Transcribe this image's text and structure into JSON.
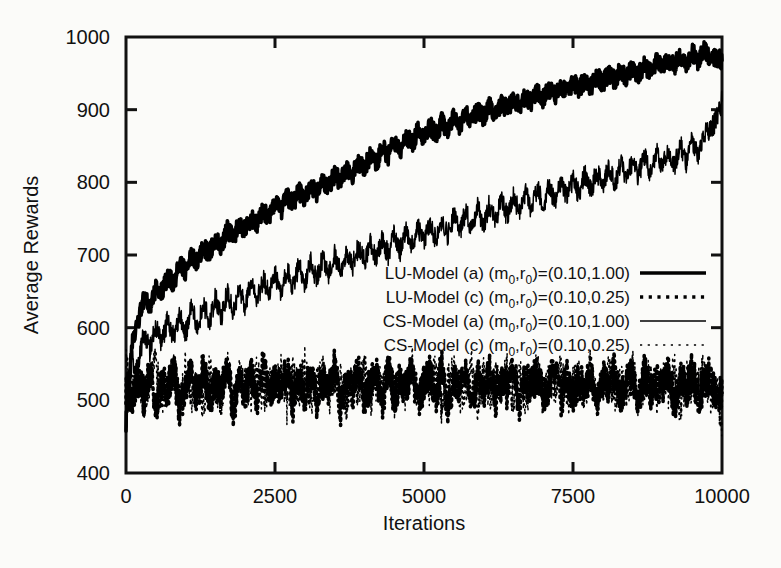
{
  "chart_data": {
    "type": "line",
    "title": "",
    "xlabel": "Iterations",
    "ylabel": "Average Rewards",
    "xlim": [
      0,
      10000
    ],
    "ylim": [
      400,
      1000
    ],
    "xticks": [
      0,
      2500,
      5000,
      7500,
      10000
    ],
    "yticks": [
      400,
      500,
      600,
      700,
      800,
      900,
      1000
    ],
    "xticklabels": [
      "0",
      "2500",
      "5000",
      "7500",
      "10000"
    ],
    "yticklabels": [
      "400",
      "500",
      "600",
      "700",
      "800",
      "900",
      "1000"
    ],
    "grid": false,
    "legend_position": "center-right-inside",
    "series": [
      {
        "name": "LU-Model (a) (m0,r0)=(0.10,1.00)",
        "style": "thick-solid",
        "color": "#000000",
        "x": [
          0,
          100,
          200,
          300,
          400,
          500,
          600,
          700,
          800,
          900,
          1000,
          1100,
          1200,
          1300,
          1400,
          1500,
          1600,
          1700,
          1800,
          1900,
          2000,
          2100,
          2200,
          2300,
          2400,
          2500,
          2600,
          2700,
          2800,
          2900,
          3000,
          3100,
          3200,
          3300,
          3400,
          3500,
          3600,
          3700,
          3800,
          3900,
          4000,
          4100,
          4200,
          4300,
          4400,
          4500,
          4600,
          4700,
          4800,
          4900,
          5000,
          5100,
          5200,
          5300,
          5400,
          5500,
          5600,
          5700,
          5800,
          5900,
          6000,
          6100,
          6200,
          6300,
          6400,
          6500,
          6600,
          6700,
          6800,
          6900,
          7000,
          7100,
          7200,
          7300,
          7400,
          7500,
          7600,
          7700,
          7800,
          7900,
          8000,
          8100,
          8200,
          8300,
          8400,
          8500,
          8600,
          8700,
          8800,
          8900,
          9000,
          9100,
          9200,
          9300,
          9400,
          9500,
          9600,
          9700,
          9800,
          9900,
          10000
        ],
        "y": [
          505,
          600,
          618,
          640,
          628,
          655,
          648,
          672,
          660,
          690,
          676,
          700,
          688,
          712,
          702,
          724,
          712,
          735,
          724,
          742,
          733,
          752,
          740,
          762,
          752,
          772,
          760,
          780,
          770,
          788,
          776,
          796,
          784,
          805,
          792,
          812,
          800,
          820,
          810,
          828,
          818,
          838,
          826,
          848,
          836,
          858,
          844,
          866,
          852,
          872,
          860,
          878,
          866,
          884,
          872,
          890,
          878,
          896,
          884,
          900,
          890,
          906,
          894,
          910,
          900,
          916,
          904,
          920,
          910,
          924,
          914,
          930,
          918,
          934,
          922,
          938,
          928,
          942,
          932,
          946,
          936,
          950,
          940,
          954,
          944,
          958,
          948,
          962,
          952,
          966,
          956,
          970,
          960,
          975,
          964,
          980,
          966,
          984,
          968,
          972,
          968
        ]
      },
      {
        "name": "LU-Model (c) (m0,r0)=(0.10,0.25)",
        "style": "thick-dotted",
        "color": "#000000",
        "x": [
          0,
          100,
          200,
          300,
          400,
          500,
          600,
          700,
          800,
          900,
          1000,
          1100,
          1200,
          1300,
          1400,
          1500,
          1600,
          1700,
          1800,
          1900,
          2000,
          2100,
          2200,
          2300,
          2400,
          2500,
          2600,
          2700,
          2800,
          2900,
          3000,
          3100,
          3200,
          3300,
          3400,
          3500,
          3600,
          3700,
          3800,
          3900,
          4000,
          4100,
          4200,
          4300,
          4400,
          4500,
          4600,
          4700,
          4800,
          4900,
          5000,
          5100,
          5200,
          5300,
          5400,
          5500,
          5600,
          5700,
          5800,
          5900,
          6000,
          6100,
          6200,
          6300,
          6400,
          6500,
          6600,
          6700,
          6800,
          6900,
          7000,
          7100,
          7200,
          7300,
          7400,
          7500,
          7600,
          7700,
          7800,
          7900,
          8000,
          8100,
          8200,
          8300,
          8400,
          8500,
          8600,
          8700,
          8800,
          8900,
          9000,
          9100,
          9200,
          9300,
          9400,
          9500,
          9600,
          9700,
          9800,
          9900,
          10000
        ],
        "y": [
          520,
          498,
          532,
          505,
          540,
          492,
          528,
          512,
          545,
          488,
          522,
          535,
          500,
          548,
          495,
          525,
          515,
          542,
          490,
          530,
          508,
          538,
          498,
          550,
          502,
          528,
          518,
          545,
          492,
          534,
          506,
          540,
          496,
          526,
          516,
          548,
          488,
          532,
          510,
          544,
          500,
          522,
          536,
          498,
          542,
          504,
          530,
          514,
          546,
          494,
          524,
          538,
          502,
          548,
          490,
          528,
          518,
          540,
          496,
          534,
          508,
          544,
          500,
          526,
          512,
          546,
          492,
          530,
          520,
          538,
          502,
          522,
          542,
          498,
          536,
          506,
          528,
          516,
          544,
          494,
          532,
          510,
          548,
          500,
          524,
          534,
          496,
          540,
          508,
          526,
          518,
          546,
          492,
          530,
          514,
          542,
          504,
          522,
          536,
          500,
          510
        ]
      },
      {
        "name": "CS-Model (a) (m0,r0)=(0.10,1.00)",
        "style": "thin-solid",
        "color": "#000000",
        "x": [
          0,
          100,
          200,
          300,
          400,
          500,
          600,
          700,
          800,
          900,
          1000,
          1100,
          1200,
          1300,
          1400,
          1500,
          1600,
          1700,
          1800,
          1900,
          2000,
          2100,
          2200,
          2300,
          2400,
          2500,
          2600,
          2700,
          2800,
          2900,
          3000,
          3100,
          3200,
          3300,
          3400,
          3500,
          3600,
          3700,
          3800,
          3900,
          4000,
          4100,
          4200,
          4300,
          4400,
          4500,
          4600,
          4700,
          4800,
          4900,
          5000,
          5100,
          5200,
          5300,
          5400,
          5500,
          5600,
          5700,
          5800,
          5900,
          6000,
          6100,
          6200,
          6300,
          6400,
          6500,
          6600,
          6700,
          6800,
          6900,
          7000,
          7100,
          7200,
          7300,
          7400,
          7500,
          7600,
          7700,
          7800,
          7900,
          8000,
          8100,
          8200,
          8300,
          8400,
          8500,
          8600,
          8700,
          8800,
          8900,
          9000,
          9100,
          9200,
          9300,
          9400,
          9500,
          9600,
          9700,
          9800,
          9900,
          10000
        ],
        "y": [
          500,
          580,
          555,
          596,
          568,
          604,
          578,
          612,
          586,
          620,
          592,
          628,
          600,
          634,
          608,
          642,
          614,
          650,
          622,
          656,
          630,
          662,
          636,
          668,
          644,
          674,
          650,
          680,
          656,
          686,
          662,
          690,
          666,
          696,
          672,
          700,
          678,
          706,
          684,
          712,
          690,
          718,
          694,
          722,
          700,
          728,
          706,
          734,
          712,
          738,
          716,
          744,
          720,
          750,
          726,
          754,
          732,
          760,
          736,
          766,
          742,
          770,
          748,
          776,
          752,
          782,
          758,
          786,
          762,
          792,
          768,
          796,
          772,
          802,
          778,
          806,
          782,
          812,
          788,
          816,
          792,
          822,
          796,
          828,
          802,
          832,
          808,
          838,
          812,
          844,
          818,
          848,
          822,
          854,
          828,
          860,
          834,
          866,
          870,
          886,
          912
        ]
      },
      {
        "name": "CS-Model (c) (m0,r0)=(0.10,0.25)",
        "style": "thin-dotted",
        "color": "#000000",
        "x": [
          0,
          100,
          200,
          300,
          400,
          500,
          600,
          700,
          800,
          900,
          1000,
          1100,
          1200,
          1300,
          1400,
          1500,
          1600,
          1700,
          1800,
          1900,
          2000,
          2100,
          2200,
          2300,
          2400,
          2500,
          2600,
          2700,
          2800,
          2900,
          3000,
          3100,
          3200,
          3300,
          3400,
          3500,
          3600,
          3700,
          3800,
          3900,
          4000,
          4100,
          4200,
          4300,
          4400,
          4500,
          4600,
          4700,
          4800,
          4900,
          5000,
          5100,
          5200,
          5300,
          5400,
          5500,
          5600,
          5700,
          5800,
          5900,
          6000,
          6100,
          6200,
          6300,
          6400,
          6500,
          6600,
          6700,
          6800,
          6900,
          7000,
          7100,
          7200,
          7300,
          7400,
          7500,
          7600,
          7700,
          7800,
          7900,
          8000,
          8100,
          8200,
          8300,
          8400,
          8500,
          8600,
          8700,
          8800,
          8900,
          9000,
          9100,
          9200,
          9300,
          9400,
          9500,
          9600,
          9700,
          9800,
          9900,
          10000
        ],
        "y": [
          560,
          512,
          540,
          496,
          530,
          548,
          502,
          518,
          538,
          488,
          546,
          506,
          524,
          494,
          542,
          516,
          500,
          550,
          490,
          534,
          520,
          504,
          544,
          498,
          528,
          512,
          540,
          492,
          536,
          508,
          552,
          496,
          522,
          546,
          502,
          516,
          538,
          490,
          532,
          510,
          548,
          500,
          526,
          518,
          542,
          494,
          536,
          506,
          550,
          498,
          530,
          514,
          544,
          488,
          524,
          540,
          504,
          520,
          546,
          496,
          534,
          508,
          528,
          516,
          548,
          492,
          538,
          502,
          522,
          544,
          500,
          530,
          512,
          542,
          498,
          526,
          536,
          506,
          550,
          494,
          518,
          540,
          502,
          532,
          510,
          546,
          496,
          524,
          538,
          504,
          528,
          514,
          544,
          490,
          534,
          508,
          522,
          542,
          500,
          518,
          470
        ]
      }
    ]
  },
  "legend": {
    "entries": [
      {
        "model": "LU-Model",
        "variant": "(a)",
        "params": "=(0.10,1.00)",
        "sub_m": "0",
        "sub_r": "0",
        "style": "thick-solid"
      },
      {
        "model": "LU-Model",
        "variant": "(c)",
        "params": "=(0.10,0.25)",
        "sub_m": "0",
        "sub_r": "0",
        "style": "thick-dotted"
      },
      {
        "model": "CS-Model",
        "variant": "(a)",
        "params": "=(0.10,1.00)",
        "sub_m": "0",
        "sub_r": "0",
        "style": "thin-solid"
      },
      {
        "model": "CS-Model",
        "variant": "(c)",
        "params": "=(0.10,0.25)",
        "sub_m": "0",
        "sub_r": "0",
        "style": "thin-dotted"
      }
    ]
  }
}
